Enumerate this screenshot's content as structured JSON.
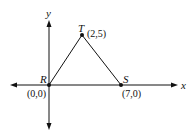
{
  "diagram": {
    "type": "coordinate-plane-triangle",
    "axes": {
      "x_label": "x",
      "y_label": "y"
    },
    "points": [
      {
        "name": "R",
        "coord_label": "(0,0)",
        "x": 0,
        "y": 0
      },
      {
        "name": "T",
        "coord_label": "(2,5)",
        "x": 2,
        "y": 5
      },
      {
        "name": "S",
        "coord_label": "(7,0)",
        "x": 7,
        "y": 0
      }
    ],
    "segments": [
      "RT",
      "TS",
      "RS"
    ],
    "colors": {
      "ink": "#111111",
      "background": "#ffffff"
    }
  }
}
